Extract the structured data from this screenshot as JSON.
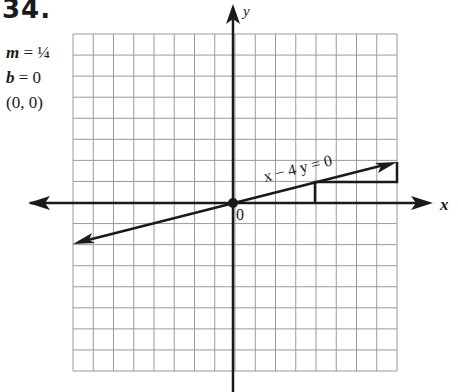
{
  "problem": {
    "number": "34.",
    "givens": [
      {
        "var": "m",
        "eq": " = ",
        "value": "¼"
      },
      {
        "var": "b",
        "eq": " = ",
        "value": "0"
      },
      {
        "var": "",
        "eq": "",
        "value": "(0, 0)"
      }
    ]
  },
  "graph": {
    "x_axis_label": "x",
    "y_axis_label": "y",
    "origin_label": "0",
    "equation_label": "x − 4 y = 0",
    "grid": {
      "x_min": -8,
      "x_max": 8,
      "y_min": -8,
      "y_max": 8,
      "step": 1
    },
    "line": {
      "slope": 0.25,
      "intercept": 0,
      "from": [
        -8,
        -2
      ],
      "to": [
        8,
        2
      ]
    },
    "slope_triangle": {
      "points": [
        [
          4,
          0
        ],
        [
          4,
          1
        ],
        [
          8,
          1
        ],
        [
          8,
          2
        ]
      ],
      "rise": 1,
      "run": 4
    },
    "point": [
      0,
      0
    ],
    "colors": {
      "ink": "#1a1a1a",
      "grid": "#9a9a9a"
    }
  }
}
